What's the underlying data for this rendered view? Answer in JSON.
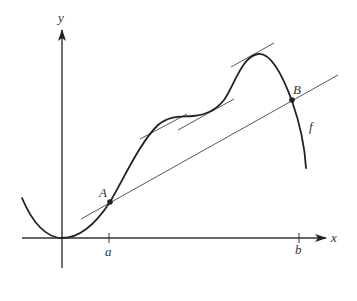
{
  "figure": {
    "axes": {
      "x_label": "x",
      "y_label": "y"
    },
    "ticks": [
      {
        "label": "a"
      },
      {
        "label": "b"
      }
    ],
    "points": [
      {
        "label": "A"
      },
      {
        "label": "B"
      }
    ],
    "curve_label": "f",
    "colors": {
      "curve": "#222222",
      "axes": "#333333",
      "lines": "#444444"
    }
  }
}
